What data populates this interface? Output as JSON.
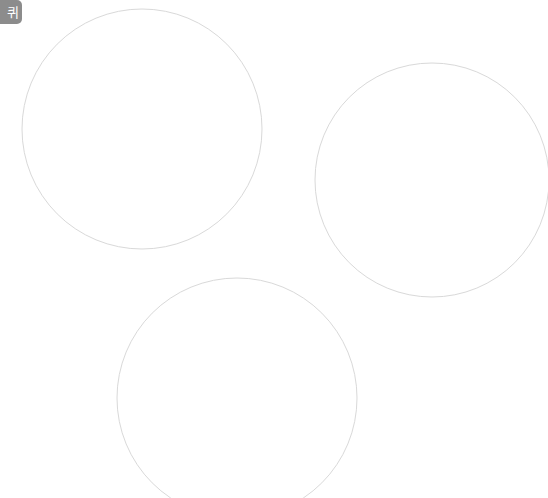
{
  "canvas": {
    "width": 548,
    "height": 498,
    "background_color": "#ffffff",
    "description": "Blank white drawing canvas with three thin outlined circles"
  },
  "badge": {
    "label": "퀴",
    "background_color": "#8c8c8c",
    "text_color": "#ffffff",
    "clipped_edge": "left"
  },
  "shapes": {
    "stroke_color": "#d9d9d9",
    "stroke_width": 1,
    "fill": "none",
    "circles": [
      {
        "name": "circle-top-left",
        "cx": 142,
        "cy": 129,
        "r": 120,
        "clipped": "none"
      },
      {
        "name": "circle-right",
        "cx": 432,
        "cy": 180,
        "r": 117,
        "clipped": "right"
      },
      {
        "name": "circle-bottom",
        "cx": 237,
        "cy": 398,
        "r": 120,
        "clipped": "bottom"
      }
    ]
  }
}
